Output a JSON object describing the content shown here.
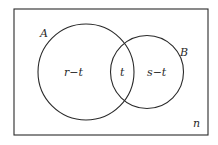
{
  "diagram": {
    "type": "venn",
    "universe_label": "n",
    "sets": [
      {
        "name": "A",
        "region_label": "r−t"
      },
      {
        "name": "B",
        "region_label": "s−t"
      }
    ],
    "intersection_label": "t",
    "colors": {
      "stroke": "#2a2a2a",
      "background": "#ffffff"
    }
  }
}
